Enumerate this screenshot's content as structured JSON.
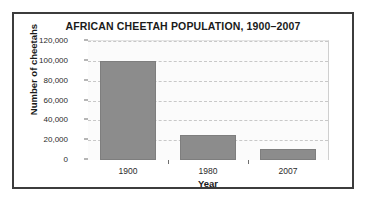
{
  "chart_data": {
    "type": "bar",
    "title": "AFRICAN CHEETAH POPULATION, 1900–2007",
    "xlabel": "Year",
    "ylabel": "Number of cheetahs",
    "categories": [
      "1900",
      "1980",
      "2007"
    ],
    "values": [
      100000,
      25000,
      11000
    ],
    "ylim": [
      0,
      120000
    ],
    "ytick_labels": [
      "120,000",
      "100,000",
      "80,000",
      "60,000",
      "40,000",
      "20,000",
      "0"
    ],
    "ytick_values": [
      120000,
      100000,
      80000,
      60000,
      40000,
      20000,
      0
    ],
    "grid": "horizontal-dashed",
    "legend": "none",
    "bar_color": "#8c8c8c",
    "plot_background": "#fbfbfb",
    "frame_color": "#3c3c3c",
    "gridline_color": "#c8c8c8",
    "axis_color": "#8d8d8d"
  }
}
